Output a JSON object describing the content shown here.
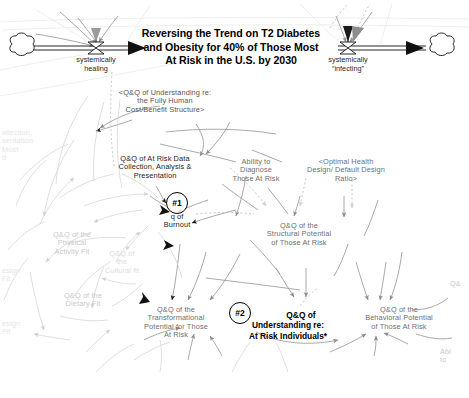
{
  "diagram": {
    "type": "causal-loop-stock-flow",
    "title": "Reversing the Trend on T2 Diabetes and Obesity for 40% of Those Most At Risk in the U.S. by 2030",
    "title_lines": [
      "Reversing the Trend on T2 Diabetes",
      "and Obesity for 40% of Those Most",
      "At Risk in the U.S. by 2030"
    ],
    "flows": [
      {
        "name": "inflow-valve",
        "label_lines": [
          "systemically",
          "healing"
        ],
        "label": "systemically healing"
      },
      {
        "name": "outflow-valve",
        "label_lines": [
          "systemically",
          "“infecting”"
        ],
        "label": "systemically “infecting”"
      }
    ],
    "nodes": [
      {
        "id": "understanding-cost-benefit",
        "lines": [
          "<Q&Q of Understanding re:",
          "the Fully Human",
          "Cost/Benefit Structure>"
        ],
        "tone": "mid"
      },
      {
        "id": "at-risk-data-collection",
        "lines": [
          "Q&Q of At Risk Data",
          "Collection, Analysis &",
          "Presentation"
        ],
        "tone": "dark"
      },
      {
        "id": "ability-to-diagnose",
        "lines": [
          "Ability to",
          "Diagnose",
          "Those At Risk"
        ],
        "tone": "normal"
      },
      {
        "id": "optimal-health-design-ratio",
        "lines": [
          "<Optimal Health",
          "Design/ Default Design",
          "Ratio>"
        ],
        "tone": "normal"
      },
      {
        "id": "structural-potential",
        "lines": [
          "Q&Q of the",
          "Structural Potential",
          "of Those At Risk"
        ],
        "tone": "normal"
      },
      {
        "id": "burnout",
        "lines": [
          "q of",
          "Burnout"
        ],
        "tone": "dark"
      },
      {
        "id": "transformational-potential",
        "lines": [
          "Q&Q of the",
          "Transformational",
          "Potential for Those",
          "At Risk"
        ],
        "tone": "normal"
      },
      {
        "id": "behavioral-potential",
        "lines": [
          "Q&Q of the",
          "Behavioral Potential",
          "of Those At Risk"
        ],
        "tone": "normal"
      },
      {
        "id": "physical-activity-fit",
        "lines": [
          "Q&Q of the",
          "Physical",
          "Activity Fit"
        ],
        "tone": "faint"
      },
      {
        "id": "dietary-fit",
        "lines": [
          "Q&Q of the",
          "Dietary Fit"
        ],
        "tone": "faint"
      },
      {
        "id": "cultural-fit",
        "lines": [
          "Q&Q of",
          "the",
          "Cultural fit"
        ],
        "tone": "vfaint"
      },
      {
        "id": "clipped-collection-left",
        "lines": [
          "ollection,",
          "sentation",
          "Most",
          "d"
        ],
        "tone": "ghost"
      },
      {
        "id": "clipped-design-fit-upper",
        "lines": [
          "esign",
          "Fit"
        ],
        "tone": "ghost"
      },
      {
        "id": "clipped-design-fit-lower",
        "lines": [
          "esign",
          "Fit"
        ],
        "tone": "ghost"
      },
      {
        "id": "clipped-ability-right",
        "lines": [
          "Abi",
          "to"
        ],
        "tone": "faint"
      },
      {
        "id": "clipped-qq-right",
        "lines": [
          "Q&"
        ],
        "tone": "faint"
      }
    ],
    "loops": [
      {
        "id": "loop-1",
        "marker": "#1",
        "attached_to": "burnout"
      },
      {
        "id": "loop-2",
        "marker": "#2",
        "attached_to": "understanding-at-risk-individuals",
        "lines": [
          "Q&Q of",
          "Understanding re:",
          "At Risk Individuals*"
        ]
      }
    ],
    "colors": {
      "background": "#ffffff",
      "text_dark": "#1c1c1c",
      "text_normal": "#6f6f6f",
      "text_faint": "#c9c9c9",
      "link_normal": "#9a9a9a",
      "link_faint": "#d8d8d8",
      "arrowhead_dark": "#1a1a1a",
      "arrowhead_grey": "#8c8c8c",
      "stock_stroke": "#000000"
    }
  }
}
